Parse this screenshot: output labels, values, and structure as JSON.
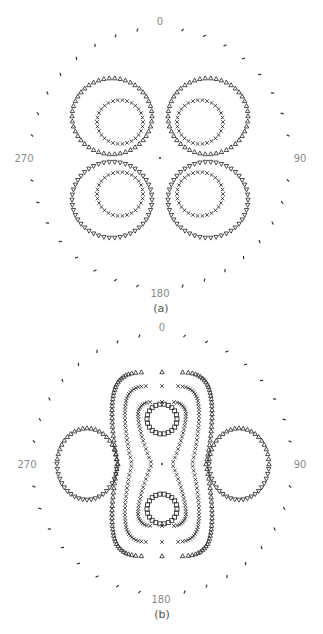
{
  "figure": {
    "colors": {
      "marker": "#222222",
      "label": "#8a8a8a",
      "caption": "#555555",
      "background": "#ffffff"
    }
  },
  "chart_data": [
    {
      "type": "scatter",
      "subtype": "polar-contour",
      "caption": "(a)",
      "center": [
        160,
        158
      ],
      "ring_radius": 130,
      "ring_ticks": 36,
      "angle_labels": {
        "top": "0",
        "right": "90",
        "bottom": "180",
        "left": "270"
      },
      "contours": [
        {
          "name": "outer-lobes",
          "marker": "triangle-up",
          "lobes": [
            {
              "cx": -48,
              "cy": -42,
              "rx": 40,
              "ry": 38,
              "n": 46,
              "marker": "triangle-up"
            },
            {
              "cx": 48,
              "cy": -42,
              "rx": 40,
              "ry": 38,
              "n": 46,
              "marker": "triangle-up"
            },
            {
              "cx": -48,
              "cy": 42,
              "rx": 40,
              "ry": 38,
              "n": 46,
              "marker": "triangle-down"
            },
            {
              "cx": 48,
              "cy": 42,
              "rx": 40,
              "ry": 38,
              "n": 46,
              "marker": "triangle-down"
            }
          ]
        },
        {
          "name": "inner-lobes",
          "marker": "x",
          "lobes": [
            {
              "cx": -40,
              "cy": -36,
              "rx": 23,
              "ry": 22,
              "n": 30
            },
            {
              "cx": 40,
              "cy": -36,
              "rx": 23,
              "ry": 22,
              "n": 30
            },
            {
              "cx": -40,
              "cy": 36,
              "rx": 23,
              "ry": 22,
              "n": 30
            },
            {
              "cx": 40,
              "cy": 36,
              "rx": 23,
              "ry": 22,
              "n": 30
            }
          ]
        }
      ]
    },
    {
      "type": "scatter",
      "subtype": "polar-contour",
      "caption": "(b)",
      "center": [
        162,
        464
      ],
      "ring_radius": 130,
      "ring_ticks": 36,
      "angle_labels": {
        "top": "0",
        "right": "90",
        "bottom": "180",
        "left": "270"
      },
      "contours": [
        {
          "name": "outer-peanut",
          "marker": "triangle-up",
          "halfwidth_max": 58,
          "waist": 44,
          "halfheight": 92,
          "n": 120
        },
        {
          "name": "middle-peanut",
          "marker": "x",
          "halfwidth_max": 44,
          "waist": 30,
          "halfheight": 78,
          "n": 110
        },
        {
          "name": "inner-peanut",
          "marker": "x",
          "halfwidth_max": 30,
          "waist": 10,
          "halfheight": 62,
          "n": 90
        },
        {
          "name": "square-rings",
          "marker": "square",
          "rings": [
            {
              "cx": 0,
              "cy": -45,
              "rx": 15,
              "ry": 15,
              "n": 22
            },
            {
              "cx": 0,
              "cy": 45,
              "rx": 15,
              "ry": 15,
              "n": 22
            }
          ]
        },
        {
          "name": "side-ellipses",
          "marker": "triangle-up",
          "rings": [
            {
              "cx": -75,
              "cy": 0,
              "rx": 30,
              "ry": 36,
              "n": 44
            },
            {
              "cx": 77,
              "cy": 0,
              "rx": 30,
              "ry": 36,
              "n": 44
            }
          ]
        }
      ]
    }
  ]
}
